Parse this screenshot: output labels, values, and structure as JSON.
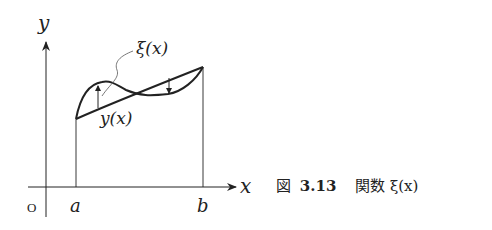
{
  "diagram": {
    "axes": {
      "y_label": "y",
      "x_label": "x",
      "origin_label": "O"
    },
    "ticks": {
      "a_label": "a",
      "b_label": "b"
    },
    "curves": {
      "straight_label": "y(x)",
      "perturbed_label": "ξ(x)"
    },
    "colors": {
      "stroke": "#222222",
      "background": "#ffffff"
    }
  },
  "caption": {
    "figure_prefix": "図",
    "figure_number": "3.13",
    "title": "関数 ξ(x)"
  }
}
